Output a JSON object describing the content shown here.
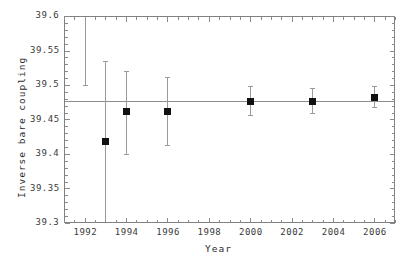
{
  "chart_data": {
    "type": "scatter",
    "title": "",
    "subtitle": "",
    "xlabel": "Year",
    "ylabel": "Inverse bare coupling",
    "xlim": [
      1991,
      2007
    ],
    "ylim": [
      39.3,
      39.6
    ],
    "xticks": [
      1992,
      1994,
      1996,
      1998,
      2000,
      2002,
      2004,
      2006
    ],
    "xtick_labels": [
      "1992",
      "1994",
      "1996",
      "1998",
      "2000",
      "2002",
      "2004",
      "2006"
    ],
    "yticks": [
      39.3,
      39.35,
      39.4,
      39.45,
      39.5,
      39.55,
      39.6
    ],
    "ytick_labels": [
      "39.3",
      "39.35",
      "39.4",
      "39.45",
      "39.5",
      "39.55",
      "39.6"
    ],
    "x_minor_tick_step": 0.5,
    "y_minor_tick_step": 0.01,
    "grid": false,
    "legend": "none",
    "legend_position": "none",
    "reference_line": {
      "orientation": "horizontal",
      "y": 39.477,
      "label": ""
    },
    "series": [
      {
        "name": "Inverse bare coupling measurements",
        "marker": "filled-square",
        "marker_color": "#111111",
        "errorbar_color": "#9a9a9a",
        "points": [
          {
            "x": 1992,
            "y": null,
            "yerr_low": 39.5,
            "yerr_high": 39.62,
            "marker_visible": false,
            "clipped_above": true
          },
          {
            "x": 1993,
            "y": 39.419,
            "yerr_low": 39.304,
            "yerr_high": 39.535,
            "marker_visible": true,
            "clipped_below": true
          },
          {
            "x": 1994,
            "y": 39.462,
            "yerr_low": 39.4,
            "yerr_high": 39.521,
            "marker_visible": true
          },
          {
            "x": 1996,
            "y": 39.462,
            "yerr_low": 39.413,
            "yerr_high": 39.512,
            "marker_visible": true
          },
          {
            "x": 2000,
            "y": 39.477,
            "yerr_low": 39.456,
            "yerr_high": 39.498,
            "marker_visible": true
          },
          {
            "x": 2003,
            "y": 39.477,
            "yerr_low": 39.459,
            "yerr_high": 39.495,
            "marker_visible": true
          },
          {
            "x": 2006,
            "y": 39.483,
            "yerr_low": 39.468,
            "yerr_high": 39.499,
            "marker_visible": true
          }
        ]
      }
    ]
  },
  "axes": {
    "x_title": "Year",
    "y_title": "Inverse bare coupling"
  }
}
